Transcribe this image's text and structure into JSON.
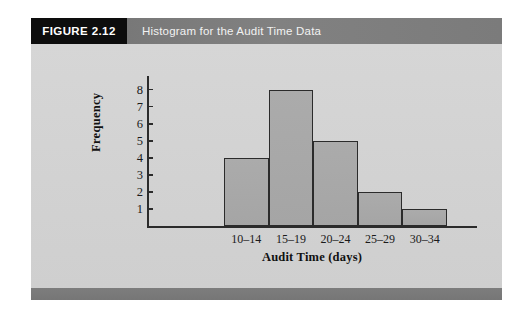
{
  "figure": {
    "number_label": "FIGURE 2.12",
    "title": "Histogram for the Audit Time Data"
  },
  "colors": {
    "caption_number_bg": "#0d0d0d",
    "caption_title_bg": "#7a7a7a",
    "caption_text": "#f2f2f2",
    "panel_bg": "#d4d4d4",
    "footer_bg": "#787878",
    "bar_fill": "#a9a9a9",
    "axis": "#2b2b2b"
  },
  "chart_data": {
    "type": "bar",
    "title": "Histogram for the Audit Time Data",
    "xlabel": "Audit Time (days)",
    "ylabel": "Frequency",
    "categories": [
      "10–14",
      "15–19",
      "20–24",
      "25–29",
      "30–34"
    ],
    "values": [
      4,
      8,
      5,
      2,
      1
    ],
    "ylim": [
      0,
      8.8
    ],
    "yticks": [
      1,
      2,
      3,
      4,
      5,
      6,
      7,
      8
    ],
    "ytick_labels": [
      "1",
      "2",
      "3",
      "4",
      "5",
      "6",
      "7",
      "8"
    ],
    "grid": false,
    "legend": null,
    "bars_contiguous": true
  }
}
